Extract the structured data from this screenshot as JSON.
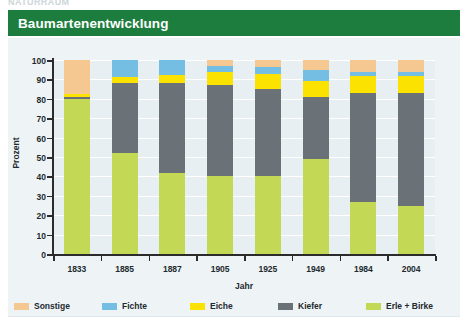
{
  "page": {
    "cut_off_text": "NATURRAUM",
    "header_title": "Baumartenentwicklung"
  },
  "legend": {
    "items": [
      {
        "label": "Sonstige",
        "color": "#f5c892"
      },
      {
        "label": "Fichte",
        "color": "#74bee4"
      },
      {
        "label": "Eiche",
        "color": "#fbe200"
      },
      {
        "label": "Kiefer",
        "color": "#6a7278"
      },
      {
        "label": "Erle + Birke",
        "color": "#c3d855"
      }
    ]
  },
  "chart_data": {
    "type": "bar",
    "stacked": true,
    "title": "Baumartenentwicklung",
    "xlabel": "Jahr",
    "ylabel": "Prozent",
    "ylim": [
      0,
      100
    ],
    "yticks": [
      0,
      10,
      20,
      30,
      40,
      50,
      60,
      70,
      80,
      90,
      100
    ],
    "grid": true,
    "legend_position": "bottom",
    "categories": [
      "1833",
      "1885",
      "1887",
      "1905",
      "1925",
      "1949",
      "1984",
      "2004"
    ],
    "series": [
      {
        "name": "Erle + Birke",
        "color": "#c3d855",
        "values": [
          80,
          52,
          42,
          40,
          40,
          49,
          27,
          25
        ]
      },
      {
        "name": "Kiefer",
        "color": "#6a7278",
        "values": [
          1,
          36,
          46,
          47,
          45,
          32,
          56,
          58
        ]
      },
      {
        "name": "Eiche",
        "color": "#fbe200",
        "values": [
          1.5,
          3,
          4.5,
          7,
          8,
          8,
          9,
          9
        ]
      },
      {
        "name": "Fichte",
        "color": "#74bee4",
        "values": [
          0,
          9,
          7.5,
          3,
          3.5,
          6,
          2,
          2
        ]
      },
      {
        "name": "Sonstige",
        "color": "#f5c892",
        "values": [
          17.5,
          0,
          0,
          3,
          3.5,
          5,
          6,
          6
        ]
      }
    ]
  }
}
